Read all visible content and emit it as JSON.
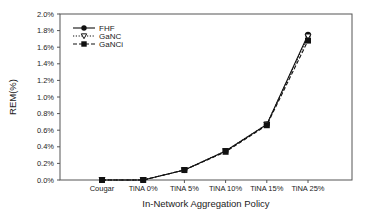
{
  "chart_data": {
    "type": "line",
    "title": "",
    "xlabel": "In-Network Aggregation Policy",
    "ylabel": "REM(%)",
    "categories": [
      "Cougar",
      "TiNA 0%",
      "TiNA 5%",
      "TiNA 10%",
      "TiNA 15%",
      "TiNA 25%"
    ],
    "series": [
      {
        "name": "FHF",
        "marker": "circle-filled",
        "line": "solid",
        "values": [
          0.0,
          0.0,
          0.12,
          0.35,
          0.67,
          1.75
        ]
      },
      {
        "name": "GaNC",
        "marker": "triangle-down-open",
        "line": "dotted",
        "values": [
          0.0,
          0.0,
          0.12,
          0.35,
          0.67,
          1.73
        ]
      },
      {
        "name": "GaNCi",
        "marker": "square-filled",
        "line": "dashed",
        "values": [
          0.0,
          0.0,
          0.12,
          0.34,
          0.66,
          1.68
        ]
      }
    ],
    "ylim": [
      0.0,
      2.0
    ],
    "yticks": [
      "0.0%",
      "0.2%",
      "0.4%",
      "0.6%",
      "0.8%",
      "1.0%",
      "1.2%",
      "1.4%",
      "1.6%",
      "1.8%",
      "2.0%"
    ],
    "grid": false,
    "legend_position": "upper-left-inside"
  }
}
